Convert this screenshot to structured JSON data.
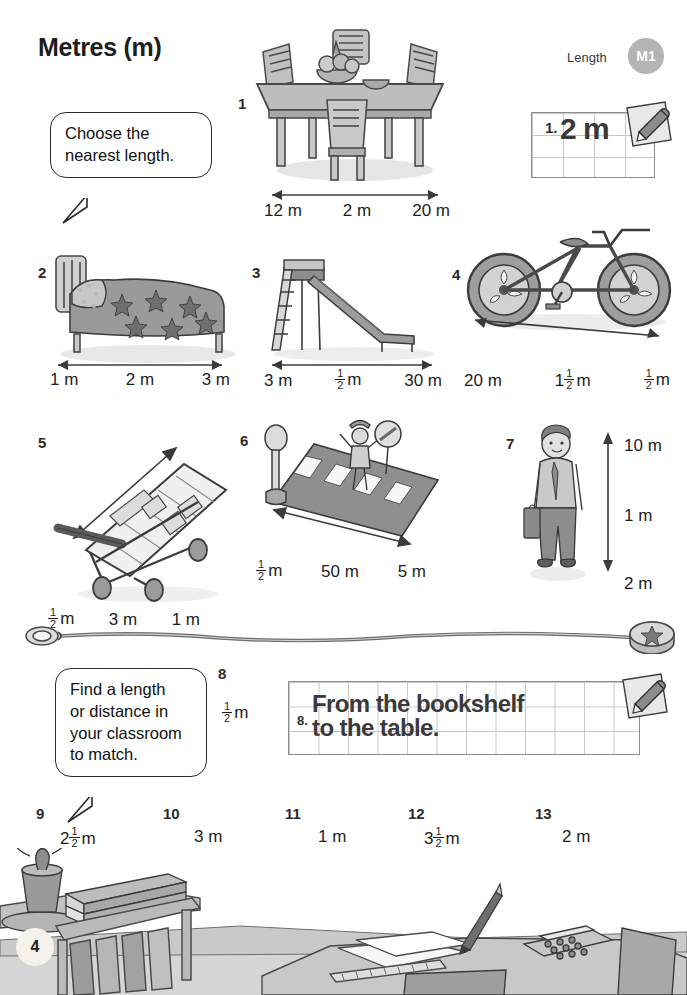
{
  "header": {
    "title": "Metres (m)",
    "section_label": "Length",
    "badge": "M1",
    "badge_color": "#b4b4b4"
  },
  "instructions": {
    "top_bubble": "Choose the\nnearest length.",
    "top_bubble_line1": "Choose the",
    "top_bubble_line2": "nearest length.",
    "bottom_bubble_line1": "Find a length",
    "bottom_bubble_line2": "or distance in",
    "bottom_bubble_line3": "your classroom",
    "bottom_bubble_line4": "to match."
  },
  "example_answer": {
    "number": "1.",
    "value": "2 m",
    "icon": "pencil-icon"
  },
  "questions": [
    {
      "number": "1",
      "subject": "dining-table",
      "options": [
        "12 m",
        "2 m",
        "20 m"
      ],
      "arrow": "horizontal"
    },
    {
      "number": "2",
      "subject": "bed",
      "options": [
        "1 m",
        "2 m",
        "3 m"
      ],
      "arrow": "horizontal"
    },
    {
      "number": "3",
      "subject": "slide",
      "options": [
        "3 m",
        "½ m",
        "30 m"
      ],
      "arrow": "horizontal"
    },
    {
      "number": "4",
      "subject": "bicycle",
      "options": [
        "20 m",
        "1½ m",
        "½ m"
      ],
      "arrow": "horizontal"
    },
    {
      "number": "5",
      "subject": "shopping-trolley",
      "options": [
        "½ m",
        "3 m",
        "1 m"
      ],
      "arrow": "diagonal"
    },
    {
      "number": "6",
      "subject": "zebra-crossing",
      "options": [
        "½ m",
        "50 m",
        "5 m"
      ],
      "arrow": "horizontal"
    },
    {
      "number": "7",
      "subject": "standing-man",
      "options": [
        "10 m",
        "1 m",
        "2 m"
      ],
      "arrow": "vertical"
    }
  ],
  "classroom_task": {
    "number": "8",
    "length": "½ m",
    "answer_number": "8.",
    "answer_line1": "From the bookshelf",
    "answer_line2": "to the table.",
    "icon": "pencil-icon"
  },
  "classroom_items": [
    {
      "number": "9",
      "length": "2½ m"
    },
    {
      "number": "10",
      "length": "3 m"
    },
    {
      "number": "11",
      "length": "1 m"
    },
    {
      "number": "12",
      "length": "3½ m"
    },
    {
      "number": "13",
      "length": "2 m"
    }
  ],
  "footer": {
    "page_number": "4"
  }
}
